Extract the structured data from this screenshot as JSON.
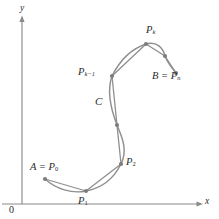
{
  "figure": {
    "kind": "math-diagram",
    "colors": {
      "curve": "#8f8f8f",
      "polygon": "#8f8f8f",
      "node": "#7d7d7d",
      "axis": "#8a8a8a",
      "text": "#2b2b2b",
      "background": "#ffffff"
    }
  },
  "axes": {
    "x_label": "x",
    "y_label": "y",
    "origin_label": "0",
    "x_axis_y_px": 204,
    "y_axis_x_px": 22,
    "x_arrow_tip_px": 202,
    "y_arrow_tip_px": 17
  },
  "labels": {
    "start_point": "A = P",
    "start_point_sub": "0",
    "p1": "P",
    "p1_sub": "1",
    "p2": "P",
    "p2_sub": "2",
    "curve": "C",
    "p_k_minus_1": "P",
    "p_k_minus_1_sub": "k−1",
    "p_k": "P",
    "p_k_sub": "k",
    "end_point": "B = P",
    "end_point_sub": "n"
  },
  "geometry": {
    "nodes": [
      {
        "name": "P0",
        "x": 45,
        "y": 179
      },
      {
        "name": "P1",
        "x": 86,
        "y": 191
      },
      {
        "name": "P2",
        "x": 121,
        "y": 164
      },
      {
        "name": "Pmid",
        "x": 117,
        "y": 125
      },
      {
        "name": "Pk-1",
        "x": 112,
        "y": 76
      },
      {
        "name": "Pk",
        "x": 146,
        "y": 44
      },
      {
        "name": "Pmid2",
        "x": 165,
        "y": 56
      },
      {
        "name": "Pn",
        "x": 176,
        "y": 73
      }
    ],
    "curve_path": "M45,179 C56,189 72,194 86,191 C102,188 114,178 121,164 C128,150 122,137 117,125 C112,112 106,93 112,76 C121,58 134,48 146,44 C157,41 163,48 165,56 C168,64 173,69 176,73",
    "polygon_path": "M45,179 L86,191 L121,164 L117,125 L112,76 L146,44 L165,56 L176,73"
  }
}
